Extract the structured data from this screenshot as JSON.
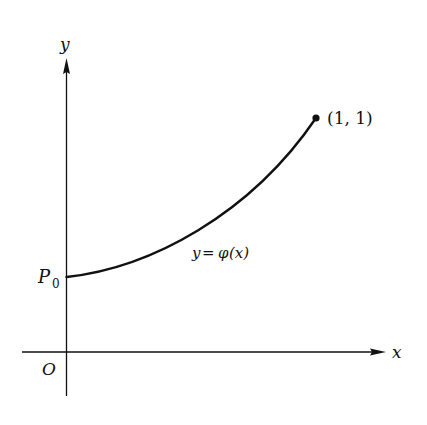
{
  "diagram": {
    "axes": {
      "x_label": "x",
      "y_label": "y",
      "origin_label": "O"
    },
    "start_point": {
      "label": "P",
      "subscript": "0"
    },
    "end_point": {
      "label": "(1, 1)"
    },
    "curve": {
      "label_lhs": "y",
      "label_eq": "=",
      "label_rhs": "φ",
      "label_arg": "(x)"
    },
    "colors": {
      "ink": "#111111",
      "background": "#ffffff"
    }
  }
}
